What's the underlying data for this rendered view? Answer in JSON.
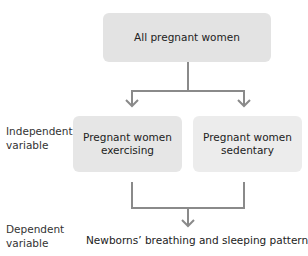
{
  "diagram": {
    "top_box": {
      "label": "All pregnant women"
    },
    "groups": [
      {
        "line1": "Pregnant women",
        "line2": "exercising"
      },
      {
        "line1": "Pregnant women",
        "line2": "sedentary"
      }
    ],
    "row_labels": {
      "independent": {
        "line1": "Independent",
        "line2": "variable"
      },
      "dependent": {
        "line1": "Dependent",
        "line2": "variable"
      }
    },
    "outcome": "Newborns’ breathing and sleeping patterns",
    "colors": {
      "box": "#e6e6e6",
      "connector": "#8a8a8a",
      "text": "#222222"
    }
  }
}
